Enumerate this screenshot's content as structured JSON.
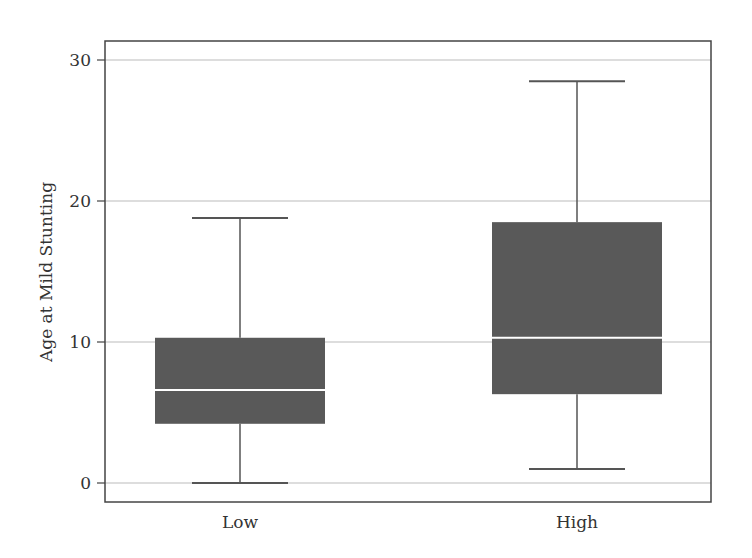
{
  "chart_data": {
    "type": "boxplot",
    "title": "",
    "xlabel": "",
    "ylabel": "Age at Mild Stunting",
    "ylim": [
      0,
      30
    ],
    "yticks": [
      0,
      10,
      20,
      30
    ],
    "grid": "horizontal",
    "legend": null,
    "categories": [
      "Low",
      "High"
    ],
    "series": [
      {
        "name": "Low",
        "whisker_low": 0.0,
        "q1": 4.2,
        "median": 6.6,
        "q3": 10.3,
        "whisker_high": 18.8
      },
      {
        "name": "High",
        "whisker_low": 1.0,
        "q1": 6.3,
        "median": 10.3,
        "q3": 18.5,
        "whisker_high": 28.5
      }
    ],
    "colors": {
      "box_fill": "#595959",
      "median_line": "#ffffff",
      "whisker": "#555555",
      "grid": "#bbbbbb",
      "frame": "#444444"
    }
  },
  "axis": {
    "y_title": "Age at Mild Stunting",
    "y_ticks": [
      "0",
      "10",
      "20",
      "30"
    ],
    "x_ticks": [
      "Low",
      "High"
    ]
  }
}
